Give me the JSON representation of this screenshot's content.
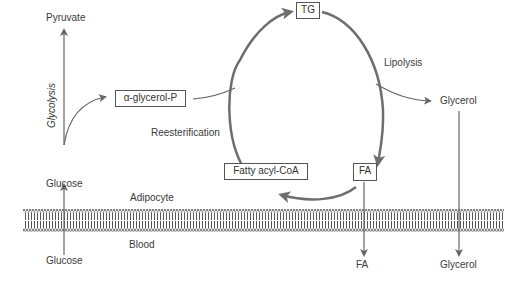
{
  "diagram": {
    "compartments": {
      "inside": "Adipocyte",
      "outside": "Blood"
    },
    "nodes": {
      "pyruvate": "Pyruvate",
      "glucose_inside": "Glucose",
      "glucose_blood": "Glucose",
      "alpha_glycerol_p": "α-glycerol-P",
      "tg": "TG",
      "fa_inside": "FA",
      "fa_blood": "FA",
      "fatty_acyl_coa": "Fatty acyl-CoA",
      "glycerol_inside": "Glycerol",
      "glycerol_blood": "Glycerol"
    },
    "processes": {
      "glycolysis": "Glycolysis",
      "lipolysis": "Lipolysis",
      "reesterification": "Reesterification"
    },
    "colors": {
      "arrow": "#666666",
      "cycle": "#6e6e6e",
      "text": "#3a3a3a",
      "membrane": "#555555"
    }
  }
}
